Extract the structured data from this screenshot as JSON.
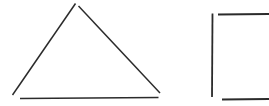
{
  "canvas": {
    "width": 269,
    "height": 106,
    "background_color": "#ffffff",
    "ink_color": "#2b2b2b",
    "ink_color_light": "#4a4a4a",
    "description": "Scanned hand-drawn sketch of two geometric line figures on blank white paper: an open triangle on the left and a partial open rectangle on the right that runs off the right edge."
  },
  "figures": [
    {
      "id": "triangle",
      "name": "Open triangle outline",
      "stroke_width": 1.4,
      "strokes": [
        {
          "id": "triangle-left-leg",
          "name": "Left slanted leg",
          "x1": 75.5,
          "y1": 3.5,
          "x2": 12.5,
          "y2": 95.0,
          "width": 1.5
        },
        {
          "id": "triangle-right-leg",
          "name": "Right slanted leg",
          "x1": 78.5,
          "y1": 6.0,
          "x2": 160.0,
          "y2": 93.0,
          "width": 1.5
        },
        {
          "id": "triangle-base",
          "name": "Horizontal base line",
          "x1": 20.0,
          "y1": 98.5,
          "x2": 158.5,
          "y2": 97.5,
          "width": 1.7
        }
      ]
    },
    {
      "id": "rectangle",
      "name": "Partial rectangle outline cropped at right edge",
      "stroke_width": 1.6,
      "strokes": [
        {
          "id": "rectangle-left-edge",
          "name": "Vertical left edge",
          "x1": 212.5,
          "y1": 13.5,
          "x2": 212.0,
          "y2": 97.0,
          "width": 1.8
        },
        {
          "id": "rectangle-top-edge",
          "name": "Horizontal top edge",
          "x1": 218.0,
          "y1": 14.5,
          "x2": 269.0,
          "y2": 14.0,
          "width": 1.8
        },
        {
          "id": "rectangle-bottom-edge",
          "name": "Horizontal bottom edge",
          "x1": 222.0,
          "y1": 99.5,
          "x2": 269.0,
          "y2": 99.0,
          "width": 1.8
        }
      ]
    }
  ]
}
